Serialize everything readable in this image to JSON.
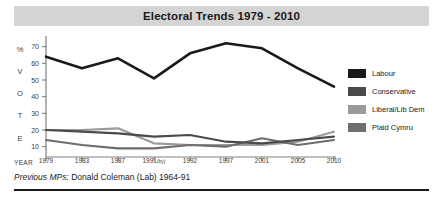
{
  "header": {
    "title": "Electoral Trends 1979 - 2010",
    "band_color": "#d4d4d4"
  },
  "axis": {
    "year_caption": "YEAR",
    "vertical_caption_letters": [
      "%",
      "V",
      "O",
      "T",
      "E"
    ]
  },
  "footer": {
    "lead": "Previous MPs:",
    "text": "Donald Coleman (Lab) 1964-91"
  },
  "legend": {
    "items": [
      {
        "label": "Labour",
        "color": "#1a1a1a"
      },
      {
        "label": "Conservative",
        "color": "#4a4a4a"
      },
      {
        "label": "Liberal/Lib Dem",
        "color": "#9a9a9a"
      },
      {
        "label": "Plaid Cymru",
        "color": "#6e6e6e"
      }
    ]
  },
  "chart_data": {
    "type": "line",
    "title": "Electoral Trends 1979 - 2010",
    "xlabel": "YEAR",
    "ylabel": "% VOTE",
    "x": [
      "1979",
      "1983",
      "1987",
      "1991(by)",
      "1992",
      "1997",
      "2001",
      "2005",
      "2010"
    ],
    "x_tick_labels": [
      "1979",
      "1983",
      "1987",
      "1991(by)",
      "1992",
      "1997",
      "2001",
      "2005",
      "2010"
    ],
    "y_ticks": [
      10,
      20,
      30,
      40,
      50,
      60,
      70
    ],
    "ylim": [
      5,
      74
    ],
    "grid": false,
    "legend_position": "right",
    "series": [
      {
        "name": "Labour",
        "color": "#1a1a1a",
        "values": [
          64,
          57,
          63,
          51,
          66,
          72,
          69,
          57,
          46
        ]
      },
      {
        "name": "Conservative",
        "color": "#4a4a4a",
        "values": [
          20,
          19,
          18,
          16,
          17,
          13,
          12,
          14,
          16
        ]
      },
      {
        "name": "Liberal/Lib Dem",
        "color": "#9a9a9a",
        "values": [
          20,
          20,
          21,
          12,
          11,
          11,
          11,
          13,
          19
        ]
      },
      {
        "name": "Plaid Cymru",
        "color": "#6e6e6e",
        "values": [
          14,
          11,
          9,
          9,
          11,
          10,
          15,
          11,
          14
        ]
      }
    ]
  }
}
